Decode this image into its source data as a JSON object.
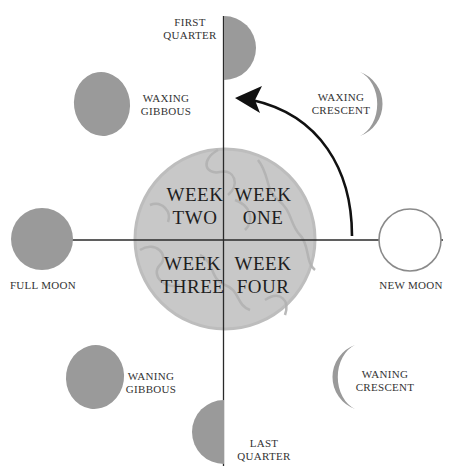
{
  "diagram": {
    "title": "",
    "colors": {
      "moon_fill": "#9a9a9a",
      "center_fill": "#c8c8c8",
      "center_texture": "#b4b4b4",
      "axis_line": "#2a2a2a",
      "arrow": "#111111",
      "new_moon_stroke": "#8a8a8a"
    },
    "weeks": {
      "one": [
        "WEEK",
        "ONE"
      ],
      "two": [
        "WEEK",
        "TWO"
      ],
      "three": [
        "WEEK",
        "THREE"
      ],
      "four": [
        "WEEK",
        "FOUR"
      ]
    },
    "phases": {
      "first_quarter": [
        "FIRST",
        "QUARTER"
      ],
      "waxing_gibbous": [
        "WAXING",
        "GIBBOUS"
      ],
      "waxing_crescent": [
        "WAXING",
        "CRESCENT"
      ],
      "full_moon": [
        "FULL MOON"
      ],
      "new_moon": [
        "NEW MOON"
      ],
      "waning_gibbous": [
        "WANING",
        "GIBBOUS"
      ],
      "waning_crescent": [
        "WANING",
        "CRESCENT"
      ],
      "last_quarter": [
        "LAST",
        "QUARTER"
      ]
    },
    "arrow_direction": "counter-clockwise"
  }
}
